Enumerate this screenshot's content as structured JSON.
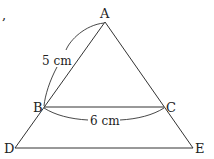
{
  "diagram": {
    "stray_mark": ",",
    "points": {
      "A": {
        "label": "A"
      },
      "B": {
        "label": "B"
      },
      "C": {
        "label": "C"
      },
      "D": {
        "label": "D"
      },
      "E": {
        "label": "E"
      }
    },
    "measurements": {
      "AB": "5 cm",
      "BC": "6 cm"
    },
    "line_color": "#333333"
  }
}
